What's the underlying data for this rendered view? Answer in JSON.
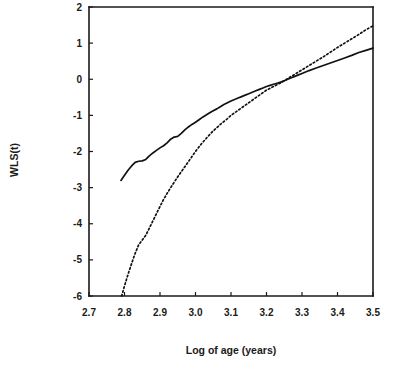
{
  "chart_data": {
    "type": "line",
    "title": "",
    "xlabel": "Log of age (years)",
    "ylabel": "WLS(t)",
    "xlim": [
      2.7,
      3.5
    ],
    "ylim": [
      -6,
      2
    ],
    "grid": false,
    "legend": "none",
    "xticks": [
      "2.7",
      "2.8",
      "2.9",
      "3.0",
      "3.1",
      "3.2",
      "3.3",
      "3.4",
      "3.5"
    ],
    "xtick_values": [
      2.7,
      2.8,
      2.9,
      3.0,
      3.1,
      3.2,
      3.3,
      3.4,
      3.5
    ],
    "yticks": [
      "2",
      "1",
      "0",
      "-1",
      "-2",
      "-3",
      "-4",
      "-5",
      "-6"
    ],
    "ytick_values": [
      2,
      1,
      0,
      -1,
      -2,
      -3,
      -4,
      -5,
      -6
    ],
    "series": [
      {
        "name": "solid-curve",
        "style": "solid",
        "color": "#111111",
        "x": [
          2.79,
          2.8,
          2.81,
          2.82,
          2.83,
          2.84,
          2.85,
          2.86,
          2.87,
          2.88,
          2.89,
          2.9,
          2.91,
          2.92,
          2.93,
          2.94,
          2.95,
          2.96,
          2.97,
          2.98,
          2.99,
          3.0,
          3.01,
          3.02,
          3.03,
          3.04,
          3.05,
          3.06,
          3.07,
          3.08,
          3.09,
          3.1,
          3.11,
          3.12,
          3.13,
          3.14,
          3.15,
          3.16,
          3.17,
          3.18,
          3.19,
          3.2,
          3.21,
          3.22,
          3.23,
          3.24,
          3.25,
          3.26,
          3.27,
          3.28,
          3.29,
          3.3,
          3.32,
          3.34,
          3.36,
          3.38,
          3.4,
          3.42,
          3.44,
          3.46,
          3.48,
          3.5
        ],
        "y": [
          -2.8,
          -2.66,
          -2.52,
          -2.4,
          -2.3,
          -2.27,
          -2.26,
          -2.22,
          -2.12,
          -2.04,
          -1.97,
          -1.9,
          -1.84,
          -1.76,
          -1.66,
          -1.6,
          -1.58,
          -1.5,
          -1.4,
          -1.32,
          -1.25,
          -1.19,
          -1.12,
          -1.05,
          -0.99,
          -0.93,
          -0.87,
          -0.82,
          -0.76,
          -0.7,
          -0.65,
          -0.6,
          -0.56,
          -0.52,
          -0.48,
          -0.44,
          -0.4,
          -0.36,
          -0.32,
          -0.28,
          -0.24,
          -0.2,
          -0.17,
          -0.14,
          -0.11,
          -0.08,
          -0.04,
          0.0,
          0.04,
          0.08,
          0.12,
          0.16,
          0.24,
          0.31,
          0.38,
          0.45,
          0.52,
          0.59,
          0.66,
          0.74,
          0.8,
          0.86
        ]
      },
      {
        "name": "dotted-curve",
        "style": "dotted",
        "color": "#111111",
        "x": [
          2.792,
          2.8,
          2.81,
          2.82,
          2.83,
          2.84,
          2.85,
          2.86,
          2.87,
          2.88,
          2.89,
          2.9,
          2.91,
          2.92,
          2.93,
          2.94,
          2.95,
          2.96,
          2.97,
          2.98,
          2.99,
          3.0,
          3.01,
          3.02,
          3.03,
          3.04,
          3.05,
          3.06,
          3.07,
          3.08,
          3.09,
          3.1,
          3.11,
          3.12,
          3.13,
          3.14,
          3.15,
          3.16,
          3.17,
          3.18,
          3.19,
          3.2,
          3.21,
          3.22,
          3.23,
          3.24,
          3.25,
          3.26,
          3.28,
          3.3,
          3.32,
          3.34,
          3.36,
          3.38,
          3.4,
          3.42,
          3.44,
          3.46,
          3.48,
          3.5
        ],
        "y": [
          -6.0,
          -5.72,
          -5.4,
          -5.1,
          -4.82,
          -4.58,
          -4.45,
          -4.32,
          -4.12,
          -3.92,
          -3.72,
          -3.52,
          -3.33,
          -3.16,
          -3.0,
          -2.85,
          -2.7,
          -2.56,
          -2.42,
          -2.28,
          -2.14,
          -2.0,
          -1.87,
          -1.75,
          -1.64,
          -1.53,
          -1.43,
          -1.34,
          -1.25,
          -1.17,
          -1.09,
          -1.0,
          -0.93,
          -0.86,
          -0.79,
          -0.72,
          -0.65,
          -0.58,
          -0.51,
          -0.44,
          -0.37,
          -0.3,
          -0.25,
          -0.2,
          -0.15,
          -0.1,
          -0.04,
          0.02,
          0.14,
          0.26,
          0.38,
          0.5,
          0.62,
          0.75,
          0.88,
          1.0,
          1.12,
          1.24,
          1.37,
          1.48
        ]
      }
    ]
  },
  "axes": {
    "x_title": "Log of age (years)",
    "y_title": "WLS(t)"
  }
}
